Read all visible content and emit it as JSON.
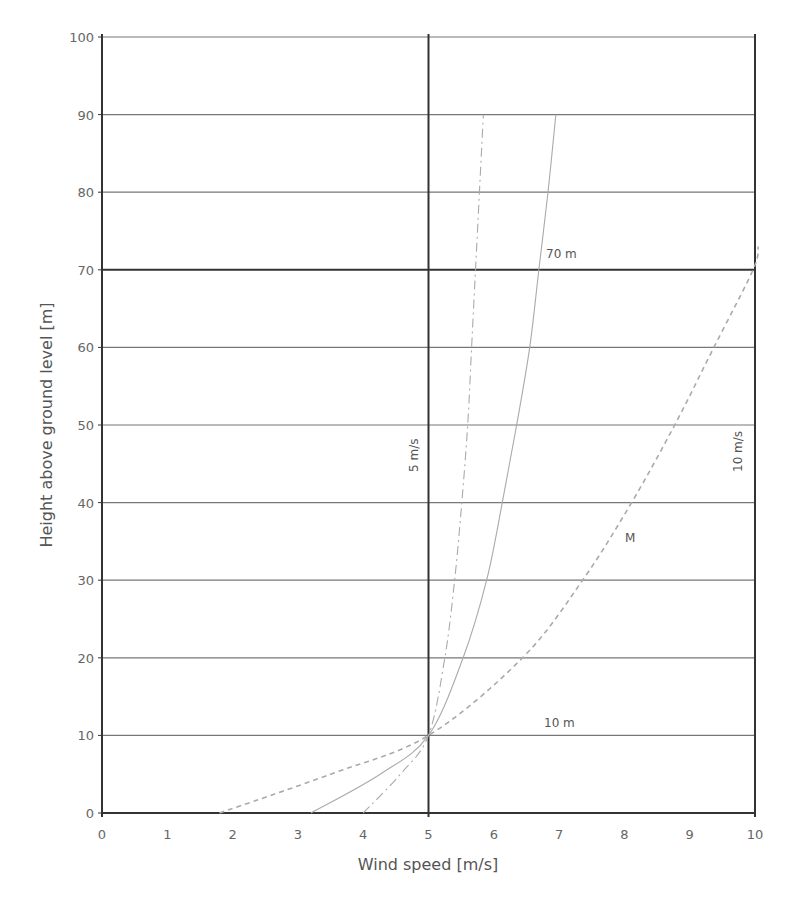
{
  "chart_data": {
    "type": "line",
    "title": "",
    "xlabel": "Wind speed [m/s]",
    "ylabel": "Height above ground level [m]",
    "xlim": [
      0,
      10
    ],
    "ylim": [
      0,
      100
    ],
    "xticks": [
      0,
      1,
      2,
      3,
      4,
      5,
      6,
      7,
      8,
      9,
      10
    ],
    "yticks": [
      0,
      10,
      20,
      30,
      40,
      50,
      60,
      70,
      80,
      90,
      100
    ],
    "grid": true,
    "emphasized_lines": {
      "x": 5,
      "y": 70
    },
    "series": [
      {
        "name": "low roughness (dash-dot)",
        "style": "dash-dot",
        "points": [
          [
            4.0,
            0
          ],
          [
            4.57,
            5
          ],
          [
            5.0,
            10
          ],
          [
            5.25,
            20
          ],
          [
            5.4,
            30
          ],
          [
            5.51,
            40
          ],
          [
            5.6,
            50
          ],
          [
            5.66,
            60
          ],
          [
            5.72,
            70
          ],
          [
            5.78,
            80
          ],
          [
            5.84,
            90
          ]
        ]
      },
      {
        "name": "medium roughness (solid)",
        "style": "solid",
        "points": [
          [
            3.2,
            0
          ],
          [
            4.26,
            5
          ],
          [
            5.0,
            10
          ],
          [
            5.53,
            20
          ],
          [
            5.89,
            30
          ],
          [
            6.13,
            40
          ],
          [
            6.35,
            50
          ],
          [
            6.55,
            60
          ],
          [
            6.69,
            70
          ],
          [
            6.83,
            80
          ],
          [
            6.95,
            90
          ]
        ]
      },
      {
        "name": "M",
        "style": "dashed",
        "points": [
          [
            1.8,
            0
          ],
          [
            3.5,
            5
          ],
          [
            5.0,
            10
          ],
          [
            6.44,
            20
          ],
          [
            7.36,
            30
          ],
          [
            8.11,
            40
          ],
          [
            8.77,
            50
          ],
          [
            9.37,
            60
          ],
          [
            9.97,
            70
          ],
          [
            10.05,
            73
          ]
        ]
      }
    ],
    "annotations": [
      {
        "text": "5 m/s",
        "x": 4.8,
        "y": 42,
        "rotation": -90
      },
      {
        "text": "10 m/s",
        "x": 9.75,
        "y": 42,
        "rotation": -90
      },
      {
        "text": "70 m",
        "x": 6.75,
        "y": 72
      },
      {
        "text": "10 m",
        "x": 6.6,
        "y": 11
      },
      {
        "text": "M",
        "x": 8.1,
        "y": 35
      }
    ]
  },
  "labels": {
    "xlabel": "Wind speed [m/s]",
    "ylabel": "Height above ground level [m]",
    "anno_5ms": "5 m/s",
    "anno_10ms": "10 m/s",
    "anno_70m": "70 m",
    "anno_10m": "10 m",
    "anno_M": "M"
  },
  "colors": {
    "grid": "#777777",
    "grid_emphasis": "#333333",
    "curve": "#aaaaaa",
    "text": "#555555"
  }
}
